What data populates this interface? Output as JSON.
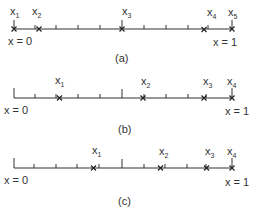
{
  "diagram": {
    "panels": [
      {
        "caption": "(a)",
        "left_label": "x = 0",
        "right_label": "x = 1",
        "points": [
          {
            "name": "x",
            "sub": "1",
            "pos": 0.0
          },
          {
            "name": "x",
            "sub": "2",
            "pos": 0.115
          },
          {
            "name": "x",
            "sub": "3",
            "pos": 0.5
          },
          {
            "name": "x",
            "sub": "4",
            "pos": 0.875
          },
          {
            "name": "x",
            "sub": "5",
            "pos": 1.0
          }
        ]
      },
      {
        "caption": "(b)",
        "left_label": "x = 0",
        "right_label": "x = 1",
        "points": [
          {
            "name": "x",
            "sub": "1",
            "pos": 0.21
          },
          {
            "name": "x",
            "sub": "2",
            "pos": 0.595
          },
          {
            "name": "x",
            "sub": "3",
            "pos": 0.875
          },
          {
            "name": "x",
            "sub": "4",
            "pos": 1.0
          }
        ]
      },
      {
        "caption": "(c)",
        "left_label": "x = 0",
        "right_label": "x = 1",
        "points": [
          {
            "name": "x",
            "sub": "1",
            "pos": 0.365
          },
          {
            "name": "x",
            "sub": "2",
            "pos": 0.67
          },
          {
            "name": "x",
            "sub": "3",
            "pos": 0.885
          },
          {
            "name": "x",
            "sub": "4",
            "pos": 1.0
          }
        ]
      }
    ]
  }
}
